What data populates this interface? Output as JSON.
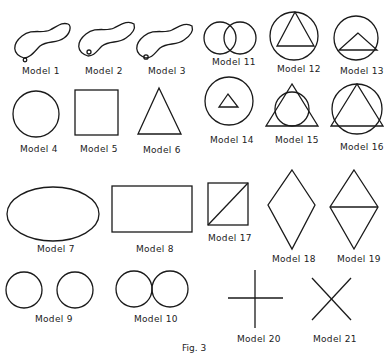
{
  "figure": {
    "caption": "Fig. 3",
    "stroke_color": "#1a1a1a",
    "models": [
      {
        "id": 1,
        "label": "Model 1",
        "shape": "closed-curve-with-loop-bottom"
      },
      {
        "id": 2,
        "label": "Model 2",
        "shape": "closed-curve-with-dot"
      },
      {
        "id": 3,
        "label": "Model 3",
        "shape": "closed-curve-with-dot-left"
      },
      {
        "id": 4,
        "label": "Model 4",
        "shape": "circle"
      },
      {
        "id": 5,
        "label": "Model 5",
        "shape": "square"
      },
      {
        "id": 6,
        "label": "Model 6",
        "shape": "triangle"
      },
      {
        "id": 7,
        "label": "Model 7",
        "shape": "ellipse"
      },
      {
        "id": 8,
        "label": "Model 8",
        "shape": "rectangle"
      },
      {
        "id": 9,
        "label": "Model 9",
        "shape": "two-separate-circles"
      },
      {
        "id": 10,
        "label": "Model 10",
        "shape": "two-touching-circles"
      },
      {
        "id": 11,
        "label": "Model 11",
        "shape": "two-overlapping-circles"
      },
      {
        "id": 12,
        "label": "Model 12",
        "shape": "triangle-inscribed-in-circle"
      },
      {
        "id": 13,
        "label": "Model 13",
        "shape": "low-triangle-in-circle"
      },
      {
        "id": 14,
        "label": "Model 14",
        "shape": "small-triangle-inside-circle"
      },
      {
        "id": 15,
        "label": "Model 15",
        "shape": "circle-inscribed-in-triangle"
      },
      {
        "id": 16,
        "label": "Model 16",
        "shape": "triangle-overlapping-circle"
      },
      {
        "id": 17,
        "label": "Model 17",
        "shape": "square-with-diagonal"
      },
      {
        "id": 18,
        "label": "Model 18",
        "shape": "diamond"
      },
      {
        "id": 19,
        "label": "Model 19",
        "shape": "diamond-with-horizontal-line"
      },
      {
        "id": 20,
        "label": "Model 20",
        "shape": "plus-cross"
      },
      {
        "id": 21,
        "label": "Model 21",
        "shape": "x-cross"
      }
    ]
  }
}
